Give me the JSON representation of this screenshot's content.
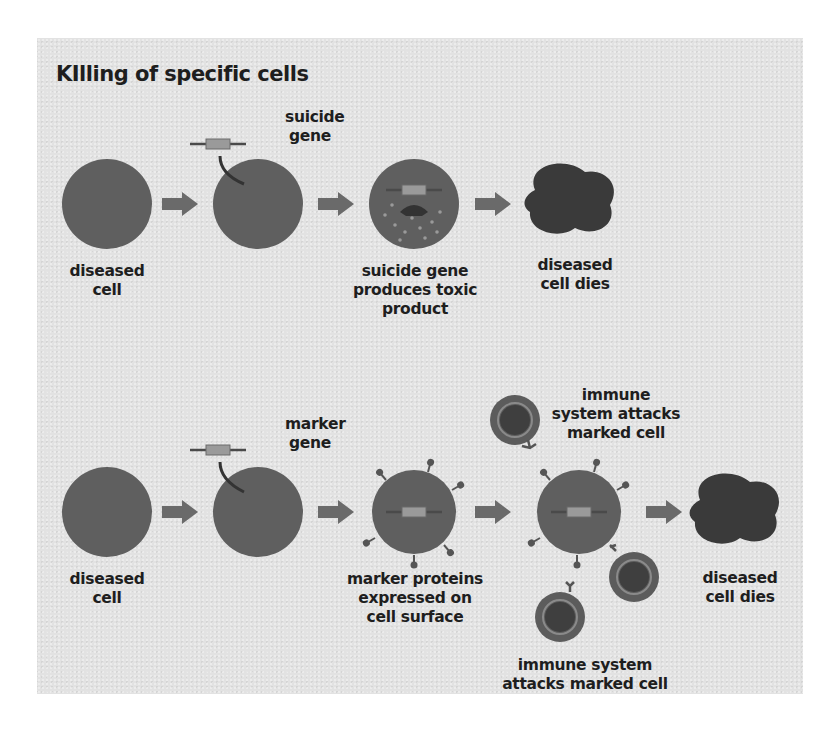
{
  "figure": {
    "title": "KIlling of specific cells",
    "colors": {
      "panel_background": "#e2e2e2",
      "cell_fill": "#5f5f5f",
      "dead_cell_fill": "#3a3a3a",
      "arrow_fill": "#6a6a6a",
      "gene_box": "#9a9a9a",
      "text": "#1e1e1e"
    },
    "top_row": {
      "name": "suicide gene pathway",
      "gene_label": [
        "suicide",
        "gene"
      ],
      "steps": [
        {
          "label": [
            "diseased",
            "cell"
          ]
        },
        {
          "label": []
        },
        {
          "label": [
            "suicide gene",
            "produces toxic",
            "product"
          ]
        },
        {
          "label": [
            "diseased",
            "cell dies"
          ]
        }
      ]
    },
    "bottom_row": {
      "name": "marker gene pathway",
      "gene_label": [
        "marker",
        "gene"
      ],
      "steps": [
        {
          "label": [
            "diseased",
            "cell"
          ]
        },
        {
          "label": []
        },
        {
          "label": [
            "marker proteins",
            "expressed on",
            "cell surface"
          ]
        },
        {
          "label": []
        },
        {
          "label": [
            "diseased",
            "cell dies"
          ]
        }
      ],
      "immune_top_label": [
        "immune",
        "system attacks",
        "marked cell"
      ],
      "immune_bottom_label": [
        "immune system",
        "attacks marked cell"
      ]
    }
  }
}
